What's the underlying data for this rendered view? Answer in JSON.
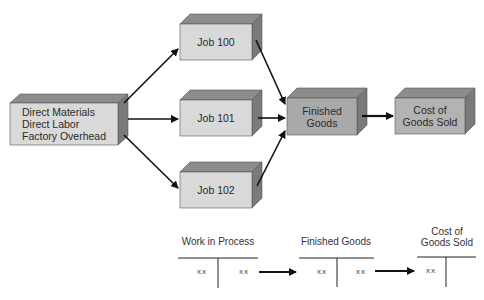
{
  "diagram": {
    "title_fragment": "",
    "boxes": {
      "source": {
        "lines": [
          "Direct Materials",
          "Direct Labor",
          "Factory Overhead"
        ]
      },
      "job100": {
        "label": "Job 100"
      },
      "job101": {
        "label": "Job 101"
      },
      "job102": {
        "label": "Job 102"
      },
      "finished": {
        "lines": [
          "Finished",
          "Goods"
        ]
      },
      "cogs": {
        "lines": [
          "Cost of",
          "Goods Sold"
        ]
      }
    },
    "edges": [
      {
        "from": "source",
        "to": "job100"
      },
      {
        "from": "source",
        "to": "job101"
      },
      {
        "from": "source",
        "to": "job102"
      },
      {
        "from": "job100",
        "to": "finished"
      },
      {
        "from": "job101",
        "to": "finished"
      },
      {
        "from": "job102",
        "to": "finished"
      },
      {
        "from": "finished",
        "to": "cogs"
      }
    ],
    "colors": {
      "light_front": "#d9d9d9",
      "dark_front": "#a9a9a9",
      "top_face": "#8c8c8c",
      "side_face": "#7a7a7a",
      "arrow": "#111111"
    }
  },
  "t_accounts": [
    {
      "title_lines": [
        "Work in Process"
      ],
      "debit": "xx",
      "credit": "xx"
    },
    {
      "title_lines": [
        "Finished Goods"
      ],
      "debit": "xx",
      "credit": "xx"
    },
    {
      "title_lines": [
        "Cost of",
        "Goods Sold"
      ],
      "debit": "xx",
      "credit": ""
    }
  ]
}
